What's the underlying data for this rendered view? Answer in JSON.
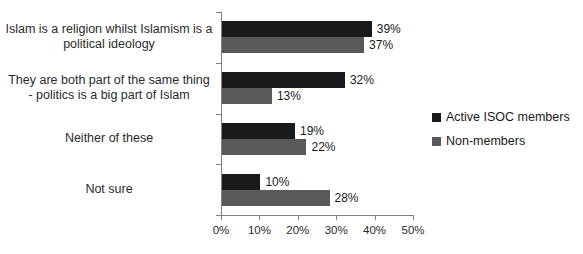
{
  "chart_data": {
    "type": "bar",
    "orientation": "horizontal",
    "title": "",
    "xlabel": "",
    "ylabel": "",
    "xlim": [
      0,
      50
    ],
    "xticks": [
      "0%",
      "10%",
      "20%",
      "30%",
      "40%",
      "50%"
    ],
    "xtick_values": [
      0,
      10,
      20,
      30,
      40,
      50
    ],
    "grid": false,
    "legend_position": "right",
    "categories": [
      "Islam is a religion whilst Islamism is a political ideology",
      "They are both part of the same thing - politics is a big part of Islam",
      "Neither of these",
      "Not sure"
    ],
    "category_lines": [
      [
        "Islam is a religion whilst Islamism is a",
        "political ideology"
      ],
      [
        "They are both part of the same thing",
        "- politics is a big part of Islam"
      ],
      [
        "Neither of these"
      ],
      [
        "Not sure"
      ]
    ],
    "series": [
      {
        "name": "Active ISOC members",
        "color": "#1a1a1a",
        "values": [
          39,
          32,
          19,
          10
        ],
        "labels": [
          "39%",
          "37%",
          "19%",
          "10%"
        ]
      },
      {
        "name": "Non-members",
        "color": "#595959",
        "values": [
          37,
          13,
          22,
          28
        ],
        "labels": [
          "37%",
          "13%",
          "22%",
          "28%"
        ]
      }
    ],
    "data_labels": [
      [
        "39%",
        "37%"
      ],
      [
        "32%",
        "13%"
      ],
      [
        "19%",
        "22%"
      ],
      [
        "10%",
        "28%"
      ]
    ]
  },
  "legend": {
    "items": [
      {
        "label": "Active ISOC members",
        "color": "#1a1a1a"
      },
      {
        "label": "Non-members",
        "color": "#595959"
      }
    ]
  },
  "colors": {
    "series_active": "#1a1a1a",
    "series_nonmembers": "#595959",
    "axis": "#808080",
    "text": "#2b2b2b",
    "background": "#ffffff"
  }
}
